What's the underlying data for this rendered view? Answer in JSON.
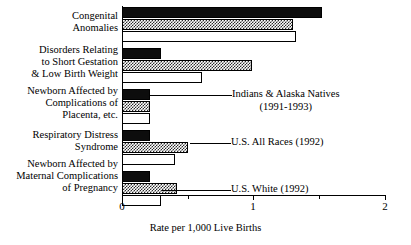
{
  "chart_data": {
    "type": "bar",
    "orientation": "horizontal",
    "title": "",
    "xlabel": "Rate per 1,000 Live Births",
    "ylabel": "",
    "xlim": [
      0,
      2
    ],
    "xticks": [
      0,
      1,
      2
    ],
    "xticklabels": [
      "0",
      "1",
      "2"
    ],
    "minor_xticks": [
      0.5,
      1.5
    ],
    "grid": false,
    "legend_position": "inline-callouts",
    "categories": [
      "Congenital Anomalies",
      "Disorders Relating to Short Gestation & Low Birth Weight",
      "Newborn Affected by Complications of Placenta, etc.",
      "Respiratory Distress Syndrome",
      "Newborn Affected by Maternal Complications of Pregnancy"
    ],
    "series": [
      {
        "name": "Indians & Alaska Natives (1991-1993)",
        "fill": "solid-black",
        "color": "#0d0d0d",
        "values": [
          1.52,
          0.3,
          0.21,
          0.21,
          0.21
        ]
      },
      {
        "name": "U.S. All Races (1992)",
        "fill": "checkered-gray",
        "color": "#2b2b2b",
        "values": [
          1.3,
          0.99,
          0.21,
          0.5,
          0.42
        ]
      },
      {
        "name": "U.S. White (1992)",
        "fill": "open-white",
        "color": "#ffffff",
        "values": [
          1.32,
          0.61,
          0.21,
          0.4,
          0.3
        ]
      }
    ]
  },
  "axis": {
    "title": "Rate per 1,000 Live Births",
    "ticks": [
      {
        "label": "0",
        "value": 0
      },
      {
        "label": "1",
        "value": 1
      },
      {
        "label": "2",
        "value": 2
      }
    ]
  },
  "categories": [
    {
      "lines": [
        "Congenital",
        "Anomalies"
      ]
    },
    {
      "lines": [
        "Disorders Relating",
        "to Short Gestation",
        "& Low Birth Weight"
      ]
    },
    {
      "lines": [
        "Newborn Affected by",
        "Complications of",
        "Placenta, etc."
      ]
    },
    {
      "lines": [
        "Respiratory Distress",
        "Syndrome"
      ]
    },
    {
      "lines": [
        "Newborn Affected by",
        "Maternal Complications",
        "of Pregnancy"
      ]
    }
  ],
  "callouts": [
    {
      "main": "Indians & Alaska Natives",
      "sub": "(1991-1993)"
    },
    {
      "main": "U.S. All Races (1992)",
      "sub": ""
    },
    {
      "main": "U.S. White (1992)",
      "sub": ""
    }
  ]
}
